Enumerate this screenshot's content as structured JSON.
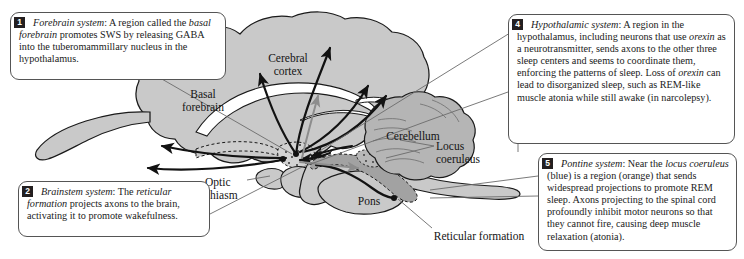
{
  "figure": {
    "background_color": "#ffffff",
    "cortex_fill": "#c9c9c9",
    "cerebellum_fill": "#b5b5b5",
    "reticular_fill": "#a2a2a2",
    "badge_color": "#231f20",
    "line_color": "#6b6b6b"
  },
  "callouts": [
    {
      "number": "1",
      "term": "Forebrain system",
      "text_html": "<i>Forebrain system</i>: A region called the <i>basal forebrain</i> promotes SWS by releasing GABA into the tuberomammillary nucleus in the hypothalamus.",
      "plain": "Forebrain system: A region called the basal forebrain promotes SWS by releasing GABA into the tuberomammillary nucleus in the hypothalamus."
    },
    {
      "number": "2",
      "term": "Brainstem system",
      "text_html": "<i>Brainstem system</i>: The <i>reticular formation</i> projects axons to the brain, activating it to promote wakefulness.",
      "plain": "Brainstem system: The reticular formation projects axons to the brain, activating it to promote wakefulness."
    },
    {
      "number": "4",
      "term": "Hypothalamic system",
      "text_html": "<i>Hypothalamic system</i>: A region in the hypothalamus, including neurons that use <i>orexin</i> as a neurotransmitter, sends axons to the other three sleep centers and seems to coordinate them, enforcing the patterns of sleep. Loss of <i>orexin</i> can lead to disorganized sleep, such as REM-like muscle atonia while still awake (in narcolepsy).",
      "plain": "Hypothalamic system: A region in the hypothalamus, including neurons that use orexin as a neurotransmitter, sends axons to the other three sleep centers and seems to coordinate them, enforcing the patterns of sleep. Loss of orexin can lead to disorganized sleep, such as REM-like muscle atonia while still awake (in narcolepsy)."
    },
    {
      "number": "5",
      "term": "Pontine system",
      "text_html": "<i>Pontine system</i>: Near the <i>locus coeruleus</i> (blue) is a region (orange) that sends widespread projections to promote REM sleep. Axons projecting to the spinal cord profoundly inhibit motor neurons so that they cannot fire, causing deep muscle relaxation (atonia).",
      "plain": "Pontine system: Near the locus coeruleus (blue) is a region (orange) that sends widespread projections to promote REM sleep. Axons projecting to the spinal cord profoundly inhibit motor neurons so that they cannot fire, causing deep muscle relaxation (atonia)."
    }
  ],
  "brain_labels": {
    "cerebral_cortex": "Cerebral\ncortex",
    "basal_forebrain": "Basal\nforebrain",
    "cerebellum": "Cerebellum",
    "locus_coeruleus": "Locus\ncoeruleus",
    "optic_chiasm": "Optic\nchiasm",
    "pons": "Pons",
    "reticular_formation": "Reticular formation"
  }
}
